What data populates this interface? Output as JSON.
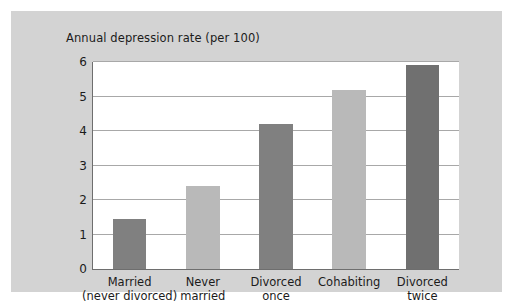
{
  "figure": {
    "background_color": "#d3d3d3",
    "page_background_color": "#ffffff",
    "plot_background_color": "#ffffff",
    "axis_color": "#6e6e6e",
    "gridline_color": "#a8a8a8"
  },
  "chart_data": {
    "type": "bar",
    "title": "Annual depression rate (per 100)",
    "xlabel": "",
    "ylabel": "",
    "ylim": [
      0,
      6
    ],
    "yticks": [
      0,
      1,
      2,
      3,
      4,
      5,
      6
    ],
    "ytick_labels": [
      "0",
      "1",
      "2",
      "3",
      "4",
      "5",
      "6"
    ],
    "grid": true,
    "legend": false,
    "categories": [
      "Married (never divorced)",
      "Never married",
      "Divorced once",
      "Cohabiting",
      "Divorced twice"
    ],
    "category_lines": [
      [
        "Married",
        "(never divorced)"
      ],
      [
        "Never",
        "married"
      ],
      [
        "Divorced",
        "once"
      ],
      [
        "Cohabiting",
        ""
      ],
      [
        "Divorced",
        "twice"
      ]
    ],
    "values": [
      1.45,
      2.4,
      4.2,
      5.2,
      5.9
    ],
    "bar_colors": [
      "#808080",
      "#b9b9b9",
      "#808080",
      "#b9b9b9",
      "#707070"
    ]
  }
}
